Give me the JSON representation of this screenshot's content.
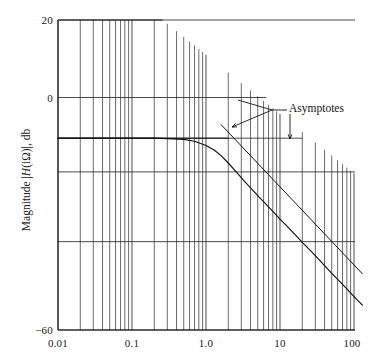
{
  "figure": {
    "kind": "bode-magnitude-plot",
    "background_color": "#ffffff",
    "ink_color": "#1a1a1a"
  },
  "axes": {
    "y_title_prefix": "Magnitude |",
    "y_title_italic": "H",
    "y_title_suffix": "(iΩ)|, db",
    "y_title_full": "Magnitude |H(iΩ)|, db",
    "x_tick_labels": [
      "0.01",
      "0.1",
      "1.0",
      "10",
      "100"
    ],
    "y_tick_labels": [
      "20",
      "0",
      "−60"
    ]
  },
  "annotations": {
    "asymptotes_label": "Asymptotes"
  },
  "chart_data": {
    "type": "line",
    "title": "",
    "xlabel": "",
    "ylabel": "Magnitude |H(iΩ)|, db",
    "xscale": "log",
    "yscale": "linear",
    "xlim": [
      0.01,
      130
    ],
    "ylim": [
      -60,
      20
    ],
    "xticks": [
      0.01,
      0.1,
      1.0,
      10,
      100
    ],
    "xticklabels": [
      "0.01",
      "0.1",
      "1.0",
      "10",
      "100"
    ],
    "yticks": [
      20,
      0,
      -60
    ],
    "yticklabels": [
      "20",
      "0",
      "−60"
    ],
    "grid": true,
    "grid_style": "log-minor-vertical-plus-horizontal",
    "horizontal_gridline_values": [
      20,
      0,
      -10.5,
      -19.2,
      -37.2,
      -60
    ],
    "legend": null,
    "series": [
      {
        "name": "magnitude-response",
        "role": "actual-curve",
        "x": [
          0.01,
          0.02,
          0.05,
          0.1,
          0.2,
          0.3,
          0.5,
          0.7,
          1.0,
          1.3,
          1.6,
          2.0,
          2.6,
          3.2,
          4.0,
          5.0,
          6.5,
          8.0,
          10.0,
          13.0,
          16.0,
          20.0,
          26.0,
          32.0,
          40.0,
          50.0,
          65.0,
          80.0,
          100.0,
          130.0
        ],
        "y": [
          -10.5,
          -10.5,
          -10.5,
          -10.5,
          -10.5,
          -10.6,
          -10.8,
          -11.3,
          -12.4,
          -13.6,
          -15.0,
          -16.9,
          -19.3,
          -21.3,
          -23.3,
          -25.3,
          -27.6,
          -29.4,
          -31.4,
          -33.6,
          -35.4,
          -37.4,
          -39.6,
          -41.4,
          -43.4,
          -45.4,
          -47.6,
          -49.4,
          -51.4,
          -53.6
        ]
      },
      {
        "name": "low-frequency-asymptote",
        "role": "asymptote",
        "x": [
          0.01,
          2.0
        ],
        "y": [
          -10.5,
          -10.5
        ]
      },
      {
        "name": "high-frequency-asymptote",
        "role": "asymptote",
        "slope_db_per_decade": -20,
        "x": [
          1.6,
          130.0
        ],
        "y": [
          -7.0,
          -45.5
        ]
      }
    ],
    "annotations": [
      {
        "text": "Asymptotes",
        "x_px": 289,
        "y_px": 108,
        "leaders": [
          {
            "type": "arrow",
            "target": "high-frequency-asymptote"
          },
          {
            "type": "arrow",
            "target": "low-frequency-asymptote"
          }
        ]
      }
    ]
  }
}
